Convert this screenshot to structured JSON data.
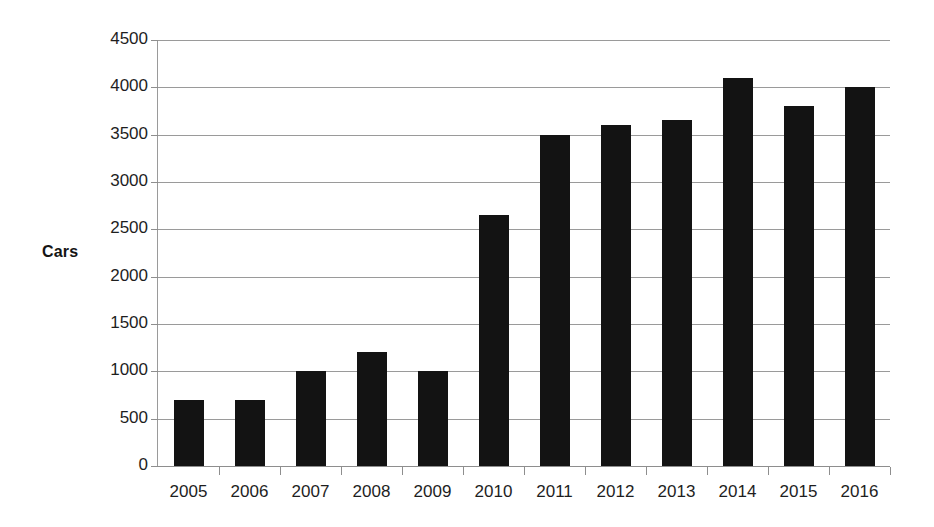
{
  "chart_data": {
    "type": "bar",
    "title": "",
    "subtitle": "",
    "xlabel": "",
    "ylabel": "Cars",
    "categories": [
      "2005",
      "2006",
      "2007",
      "2008",
      "2009",
      "2010",
      "2011",
      "2012",
      "2013",
      "2014",
      "2015",
      "2016"
    ],
    "values": [
      700,
      700,
      1000,
      1200,
      1000,
      2650,
      3500,
      3600,
      3650,
      4100,
      3800,
      4000
    ],
    "ylim": [
      0,
      4500
    ],
    "ytick_labels": [
      "0",
      "500",
      "1000",
      "1500",
      "2000",
      "2500",
      "3000",
      "3500",
      "4000",
      "4500"
    ],
    "ytick_values": [
      0,
      500,
      1000,
      1500,
      2000,
      2500,
      3000,
      3500,
      4000,
      4500
    ],
    "ytick_step": 500,
    "grid": true,
    "grid_axis": "y",
    "legend": false,
    "legend_position": "none",
    "series": [
      {
        "name": "Cars",
        "color": "#131313",
        "values": [
          700,
          700,
          1000,
          1200,
          1000,
          2650,
          3500,
          3600,
          3650,
          4100,
          3800,
          4000
        ]
      }
    ],
    "colors": {
      "bar": "#131313",
      "grid": "#9a9a9a",
      "axis": "#8e8e8e",
      "text": "#1e1e1e",
      "background": "#ffffff"
    },
    "annotations": []
  }
}
